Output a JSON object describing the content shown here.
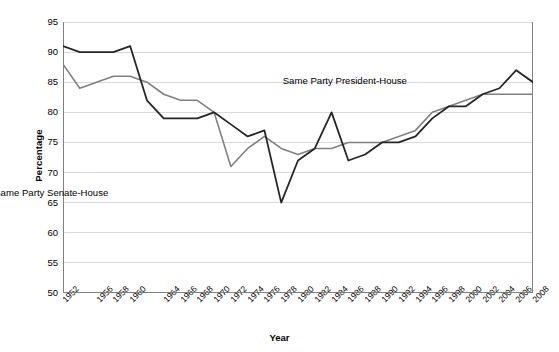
{
  "chart_data": {
    "type": "line",
    "title": "",
    "xlabel": "Year",
    "ylabel": "Percentage",
    "ylim": [
      50,
      95
    ],
    "ytick_values": [
      50,
      55,
      60,
      65,
      70,
      75,
      80,
      85,
      90,
      95
    ],
    "grid": "horizontal",
    "legend": "inline-annotations",
    "x": [
      1952,
      1954,
      1956,
      1958,
      1960,
      1962,
      1964,
      1966,
      1968,
      1970,
      1972,
      1974,
      1976,
      1978,
      1980,
      1982,
      1984,
      1986,
      1988,
      1990,
      1992,
      1994,
      1996,
      1998,
      2000,
      2002,
      2004,
      2006,
      2008
    ],
    "xtick_labels": [
      "1952",
      "1956",
      "1958",
      "1960",
      "1964",
      "1966",
      "1968",
      "1970",
      "1972",
      "1974",
      "1976",
      "1978",
      "1980",
      "1982",
      "1984",
      "1986",
      "1988",
      "1990",
      "1992",
      "1994",
      "1996",
      "1998",
      "2000",
      "2002",
      "2004",
      "2006",
      "2008"
    ],
    "series": [
      {
        "name": "Same Party President-House",
        "color": "#262626",
        "values": [
          91,
          90,
          90,
          90,
          91,
          82,
          79,
          79,
          79,
          80,
          78,
          76,
          77,
          65,
          72,
          74,
          80,
          72,
          73,
          75,
          75,
          76,
          79,
          81,
          81,
          83,
          84,
          87,
          85
        ]
      },
      {
        "name": "Same Party Senate-House",
        "color": "#808080",
        "values": [
          88,
          84,
          85,
          86,
          86,
          85,
          83,
          82,
          82,
          80,
          71,
          74,
          76,
          74,
          73,
          74,
          74,
          75,
          75,
          75,
          76,
          77,
          80,
          81,
          82,
          83,
          83,
          83,
          83
        ]
      }
    ],
    "annotations": [
      {
        "text": "Same Party President-House",
        "x": 1992,
        "y": 85.2
      },
      {
        "text": "Same Party Senate-House",
        "x": 1979.5,
        "y": 66.6
      }
    ]
  }
}
